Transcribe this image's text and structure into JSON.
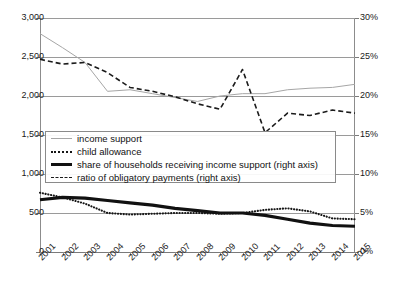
{
  "chart_data": {
    "type": "line",
    "title": "",
    "xlabel": "",
    "ylabel": "",
    "grid": true,
    "legend_position": "inside-left-middle",
    "categories": [
      2001,
      2002,
      2003,
      2004,
      2005,
      2006,
      2007,
      2008,
      2009,
      2010,
      2011,
      2012,
      2013,
      2014,
      2015
    ],
    "left_axis": {
      "label": "",
      "ylim": [
        0,
        3000
      ],
      "ticks": [
        0,
        500,
        1000,
        1500,
        2000,
        2500,
        3000
      ],
      "tick_labels": [
        "0",
        "500",
        "1,000",
        "1,500",
        "2,000",
        "2,500",
        "3,000"
      ]
    },
    "right_axis": {
      "label": "",
      "ylim": [
        0,
        30
      ],
      "ticks": [
        0,
        5,
        10,
        15,
        20,
        25,
        30
      ],
      "tick_labels": [
        "0%",
        "5%",
        "10%",
        "15%",
        "20%",
        "25%",
        "30%"
      ]
    },
    "series": [
      {
        "name": "income support",
        "axis": "left",
        "style": "solid-thin",
        "color": "#a6a6a6",
        "values": [
          2800,
          2620,
          2430,
          2060,
          2080,
          2030,
          1980,
          1930,
          2000,
          2030,
          2030,
          2080,
          2100,
          2110,
          2150
        ]
      },
      {
        "name": "child allowance",
        "axis": "left",
        "style": "dotted",
        "color": "#161616",
        "values": [
          760,
          700,
          620,
          500,
          480,
          490,
          500,
          500,
          490,
          500,
          540,
          560,
          520,
          430,
          420
        ]
      },
      {
        "name": "share of households receiving income support (right axis)",
        "axis": "right",
        "style": "solid-thick",
        "color": "#111111",
        "values": [
          6.7,
          7.0,
          6.9,
          6.6,
          6.3,
          6.0,
          5.6,
          5.3,
          5.0,
          5.0,
          4.7,
          4.2,
          3.7,
          3.4,
          3.3
        ]
      },
      {
        "name": "ratio of obligatory payments (right axis)",
        "axis": "right",
        "style": "dashed",
        "color": "#1b1b1b",
        "values": [
          24.7,
          24.1,
          24.3,
          23.0,
          21.1,
          20.6,
          19.9,
          19.0,
          18.3,
          23.4,
          15.3,
          17.8,
          17.5,
          18.2,
          17.8
        ]
      }
    ]
  },
  "legend": {
    "items": [
      {
        "label": "income support"
      },
      {
        "label": "child allowance"
      },
      {
        "label": "share of households receiving income support (right axis)"
      },
      {
        "label": "ratio of obligatory payments (right axis)"
      }
    ]
  }
}
